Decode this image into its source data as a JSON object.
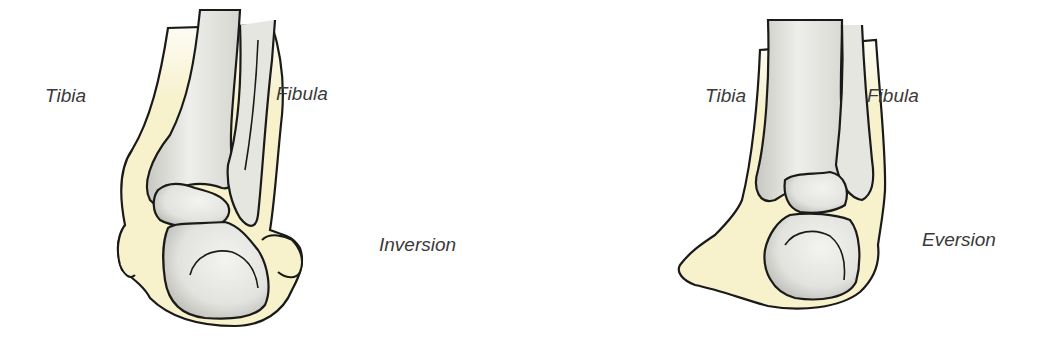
{
  "figure": {
    "panels": [
      {
        "id": "inversion",
        "labels": {
          "tibia": "Tibia",
          "fibula": "Fibula",
          "motion": "Inversion"
        }
      },
      {
        "id": "eversion",
        "labels": {
          "tibia": "Tibia",
          "fibula": "Fibula",
          "motion": "Eversion"
        }
      }
    ],
    "colors": {
      "outline": "#1a1a1a",
      "soft_tissue": "#f7f1cc",
      "bone_light": "#ededea",
      "bone_shadow": "#c4c4c0",
      "label_text": "#3a3a3a",
      "background": "#ffffff"
    }
  }
}
